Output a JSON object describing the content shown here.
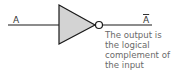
{
  "diagram": {
    "type": "NOT gate",
    "input_label": "A",
    "output_label": "A",
    "output_overline": true,
    "description_lines": [
      "The output is",
      "the logical",
      "complement of",
      "the input"
    ],
    "colors": {
      "gate_fill": "#d3d3d3",
      "stroke": "#1a1a1a",
      "text": "#6a6a6a"
    }
  }
}
